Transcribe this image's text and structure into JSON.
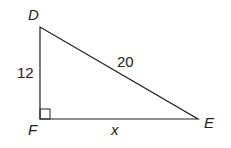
{
  "diagram": {
    "type": "right-triangle",
    "vertices": {
      "D": {
        "label": "D",
        "x": 40,
        "y": 27
      },
      "F": {
        "label": "F",
        "x": 40,
        "y": 119
      },
      "E": {
        "label": "E",
        "x": 198,
        "y": 119
      }
    },
    "sides": {
      "DF": {
        "label": "12"
      },
      "DE": {
        "label": "20"
      },
      "FE": {
        "label": "x"
      }
    },
    "right_angle_at": "F",
    "colors": {
      "stroke": "#222222",
      "background": "#ffffff"
    }
  }
}
